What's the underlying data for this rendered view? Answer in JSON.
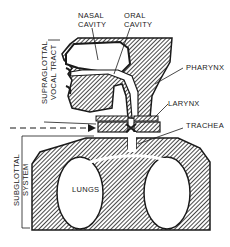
{
  "diagram": {
    "labels": {
      "nasal_cavity_line1": "NASAL",
      "nasal_cavity_line2": "CAVITY",
      "oral_cavity_line1": "ORAL",
      "oral_cavity_line2": "CAVITY",
      "pharynx": "PHARYNX",
      "larynx": "LARYNX",
      "trachea": "TRACHEA",
      "lungs": "LUNGS",
      "supraglottal_line1": "SUPRAGLOTTAL",
      "supraglottal_line2": "VOCAL TRACT",
      "subglottal_line1": "SUBGLOTTAL",
      "subglottal_line2": "SYSTEM"
    },
    "colors": {
      "ink": "#1a1a1a",
      "background": "#ffffff"
    }
  }
}
